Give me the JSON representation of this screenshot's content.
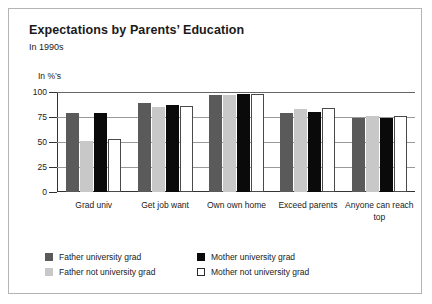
{
  "panel": {
    "title": "Expectations by Parents’ Education",
    "subtitle": "In 1990s"
  },
  "chart_data": {
    "type": "bar",
    "title": "Expectations by Parents’ Education",
    "subtitle": "In 1990s",
    "xlabel": "",
    "ylabel": "In %’s",
    "ylim": [
      0,
      100
    ],
    "yticks": [
      0,
      25,
      50,
      75,
      100
    ],
    "ytick_labels": [
      "0",
      "25",
      "50",
      "75",
      "100"
    ],
    "grid": true,
    "legend_position": "bottom",
    "categories": [
      "Grad univ",
      "Get job want",
      "Own own home",
      "Exceed parents",
      "Anyone can reach top"
    ],
    "series": [
      {
        "name": "Father university grad",
        "color": "#5a5a5a",
        "values": [
          79,
          89,
          97,
          79,
          74
        ]
      },
      {
        "name": "Father not university grad",
        "color": "#c8c8c8",
        "values": [
          51,
          85,
          97,
          83,
          76
        ]
      },
      {
        "name": "Mother university grad",
        "color": "#0a0a0a",
        "values": [
          79,
          87,
          98,
          80,
          74
        ]
      },
      {
        "name": "Mother not university grad",
        "color": "#ffffff",
        "values": [
          53,
          86,
          98,
          84,
          76
        ]
      }
    ]
  }
}
